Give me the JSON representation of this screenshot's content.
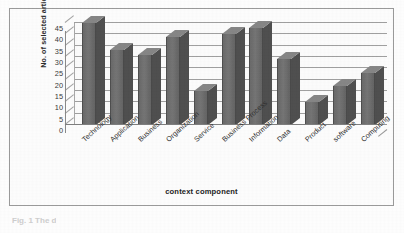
{
  "figure": {
    "y_axis_title": "No. of selected articles",
    "x_axis_title": "context component",
    "caption_fragment": "Fig. 1 The d"
  },
  "colors": {
    "bar_front": "#6e6e6e",
    "bar_side": "#4f4f4f",
    "bar_top": "#868686",
    "gridline": "#8f8f8f",
    "axis": "#8a8a8a",
    "frame": "#9b9b9b",
    "text": "#2b2b2b",
    "background": "#fdfdfd"
  },
  "chart_data": {
    "type": "bar",
    "title": "",
    "subtitle": "",
    "xlabel": "context component",
    "ylabel": "No. of selected articles",
    "categories": [
      "Technology",
      "Application",
      "Business",
      "Organization",
      "Service",
      "Business Process",
      "Information",
      "Data",
      "Product",
      "software",
      "Computing"
    ],
    "values": [
      45,
      33,
      31,
      39,
      15,
      40,
      43,
      29,
      10,
      17,
      23
    ],
    "ylim": [
      0,
      45
    ],
    "ytick_values": [
      0,
      5,
      10,
      15,
      20,
      25,
      30,
      35,
      40,
      45
    ],
    "ytick_labels": [
      "0",
      "5",
      "10",
      "15",
      "20",
      "25",
      "30",
      "35",
      "40",
      "45"
    ],
    "ytick_step": 5,
    "grid": true,
    "grid_axis": "y",
    "legend": false,
    "legend_position": "none",
    "style": "3d-column",
    "annotations": []
  }
}
